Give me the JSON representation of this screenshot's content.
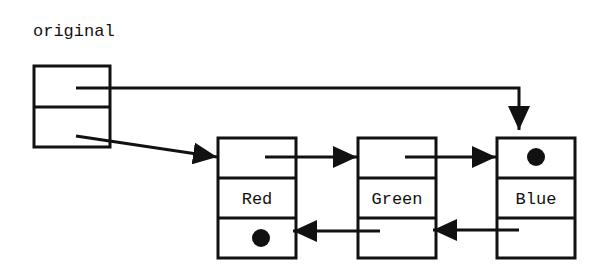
{
  "title": "original",
  "head": {
    "name": "original",
    "fields": [
      "first",
      "last"
    ]
  },
  "nodes": [
    {
      "id": "red",
      "value": "Red",
      "next": "green",
      "prev": null,
      "prev_is_null": true,
      "next_is_null": false
    },
    {
      "id": "green",
      "value": "Green",
      "next": "blue",
      "prev": "red",
      "prev_is_null": false,
      "next_is_null": false
    },
    {
      "id": "blue",
      "value": "Blue",
      "next": null,
      "prev": "green",
      "prev_is_null": false,
      "next_is_null": true
    }
  ],
  "null_marker": "filled-dot",
  "colors": {
    "stroke": "#111111",
    "background": "#ffffff"
  }
}
